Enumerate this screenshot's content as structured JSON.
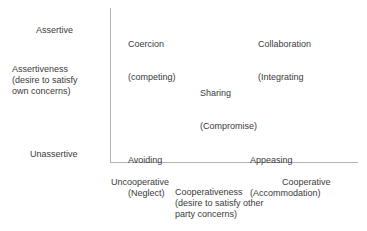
{
  "diagram": {
    "type": "conflict-handling-styles-grid",
    "y_axis": {
      "high_label": "Assertive",
      "low_label": "Unassertive",
      "title": "Assertiveness\n(desire to satisfy\nown concerns)"
    },
    "x_axis": {
      "low_label": "Uncooperative",
      "high_label": "Cooperative",
      "title": "Cooperativeness\n(desire to satisfy other\nparty concerns)"
    },
    "styles": [
      {
        "id": "coercion",
        "name": "Coercion",
        "alt": "(competing)",
        "position": "top-left"
      },
      {
        "id": "collaboration",
        "name": "Collaboration",
        "alt": "(Integrating",
        "position": "top-right"
      },
      {
        "id": "sharing",
        "name": "Sharing",
        "alt": "(Compromise)",
        "position": "center"
      },
      {
        "id": "avoiding",
        "name": "Avoiding",
        "alt": "(Neglect)",
        "position": "bottom-left"
      },
      {
        "id": "appeasing",
        "name": "Appeasing",
        "alt": "(Accommodation)",
        "position": "bottom-right"
      }
    ]
  },
  "colors": {
    "text": "#3a3a3a",
    "axis": "#b5b5b5",
    "background": "#ffffff"
  }
}
